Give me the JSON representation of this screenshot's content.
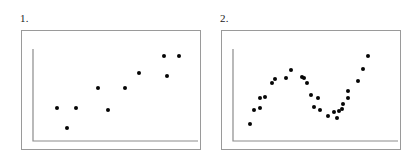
{
  "figure": {
    "background_color": "#ffffff",
    "frame_color": "#9a9a9a",
    "axis_color": "#8c8c8c",
    "point_color": "#050505"
  },
  "panels": [
    {
      "label": "1.",
      "name": "scatter-panel-1",
      "frame": {
        "x": 21,
        "y": 30,
        "width": 180,
        "height": 120
      },
      "axes": {
        "origin_x": 11,
        "origin_y": 110,
        "y_axis_top": 18,
        "x_axis_right": 176
      },
      "chart": {
        "type": "scatter",
        "title": "1.",
        "xlabel": "",
        "ylabel": "",
        "grid": false,
        "legend": "none",
        "n_points": 10,
        "description": "increasing linear trend with scatter",
        "points": [
          {
            "px": 35,
            "py": 77
          },
          {
            "px": 45,
            "py": 97
          },
          {
            "px": 54,
            "py": 77
          },
          {
            "px": 76,
            "py": 57
          },
          {
            "px": 86,
            "py": 79
          },
          {
            "px": 103,
            "py": 57
          },
          {
            "px": 117,
            "py": 42
          },
          {
            "px": 142,
            "py": 25
          },
          {
            "px": 145,
            "py": 45
          },
          {
            "px": 157,
            "py": 25
          }
        ]
      }
    },
    {
      "label": "2.",
      "name": "scatter-panel-2",
      "frame": {
        "x": 15,
        "y": 30,
        "width": 180,
        "height": 120
      },
      "axes": {
        "origin_x": 11,
        "origin_y": 110,
        "y_axis_top": 18,
        "x_axis_right": 176
      },
      "chart": {
        "type": "scatter",
        "title": "2.",
        "xlabel": "",
        "ylabel": "",
        "grid": false,
        "legend": "none",
        "n_points": 27,
        "description": "non-linear wave: rise, peak, dip to trough, then sharp rise",
        "points": [
          {
            "px": 28,
            "py": 93
          },
          {
            "px": 32,
            "py": 79
          },
          {
            "px": 38,
            "py": 77
          },
          {
            "px": 38,
            "py": 67
          },
          {
            "px": 43,
            "py": 66
          },
          {
            "px": 50,
            "py": 52
          },
          {
            "px": 53,
            "py": 48
          },
          {
            "px": 64,
            "py": 47
          },
          {
            "px": 69,
            "py": 39
          },
          {
            "px": 80,
            "py": 46
          },
          {
            "px": 85,
            "py": 52
          },
          {
            "px": 82,
            "py": 47
          },
          {
            "px": 89,
            "py": 64
          },
          {
            "px": 96,
            "py": 67
          },
          {
            "px": 98,
            "py": 79
          },
          {
            "px": 92,
            "py": 76
          },
          {
            "px": 106,
            "py": 85
          },
          {
            "px": 112,
            "py": 81
          },
          {
            "px": 115,
            "py": 87
          },
          {
            "px": 117,
            "py": 80
          },
          {
            "px": 120,
            "py": 78
          },
          {
            "px": 126,
            "py": 60
          },
          {
            "px": 126,
            "py": 67
          },
          {
            "px": 121,
            "py": 73
          },
          {
            "px": 136,
            "py": 50
          },
          {
            "px": 141,
            "py": 38
          },
          {
            "px": 146,
            "py": 25
          }
        ]
      }
    }
  ]
}
